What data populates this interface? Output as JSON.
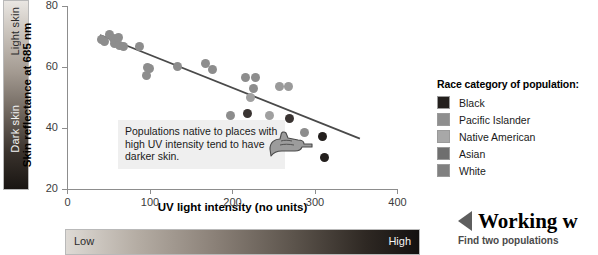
{
  "skin_scale": {
    "light_label": "Light skin",
    "dark_label": "Dark skin"
  },
  "uv_scale": {
    "low_label": "Low",
    "high_label": "High"
  },
  "annotation": {
    "text": "Populations native to places with high UV intensity tend to have darker skin.",
    "icon": "pointing-hand-icon"
  },
  "legend": {
    "title": "Race category of population:",
    "items": [
      {
        "label": "Black",
        "color": "#231f1d"
      },
      {
        "label": "Pacific Islander",
        "color": "#8e8e8e"
      },
      {
        "label": "Native American",
        "color": "#a8a8a8"
      },
      {
        "label": "Asian",
        "color": "#6f6f6f"
      },
      {
        "label": "White",
        "color": "#808080"
      }
    ]
  },
  "callout": {
    "title": "Working w",
    "subtitle": "Find two populations"
  },
  "chart_data": {
    "type": "scatter",
    "title": "",
    "xlabel": "UV light intensity (no units)",
    "ylabel": "Skin reflectance at 685 nm",
    "xlim": [
      0,
      400
    ],
    "ylim": [
      20,
      80
    ],
    "xticks": [
      0,
      100,
      200,
      300,
      400
    ],
    "yticks": [
      20,
      40,
      60,
      80
    ],
    "grid": false,
    "legend_position": "right",
    "trendline": {
      "x0": 40,
      "y0": 70.5,
      "x1": 355,
      "y1": 36.5,
      "color": "#4a4a4a"
    },
    "points": [
      {
        "x": 42,
        "y": 69.0,
        "color": "#8d8d8d"
      },
      {
        "x": 46,
        "y": 68.4,
        "color": "#8d8d8d"
      },
      {
        "x": 52,
        "y": 70.6,
        "color": "#8d8d8d"
      },
      {
        "x": 56,
        "y": 69.4,
        "color": "#8d8d8d"
      },
      {
        "x": 58,
        "y": 67.6,
        "color": "#8d8d8d"
      },
      {
        "x": 62,
        "y": 69.8,
        "color": "#8d8d8d"
      },
      {
        "x": 64,
        "y": 67.0,
        "color": "#8d8d8d"
      },
      {
        "x": 68,
        "y": 66.8,
        "color": "#8d8d8d"
      },
      {
        "x": 88,
        "y": 66.8,
        "color": "#8d8d8d"
      },
      {
        "x": 98,
        "y": 60.0,
        "color": "#8d8d8d"
      },
      {
        "x": 100,
        "y": 59.4,
        "color": "#8d8d8d"
      },
      {
        "x": 96,
        "y": 57.2,
        "color": "#8d8d8d"
      },
      {
        "x": 134,
        "y": 60.2,
        "color": "#8d8d8d"
      },
      {
        "x": 168,
        "y": 61.0,
        "color": "#8d8d8d"
      },
      {
        "x": 176,
        "y": 59.2,
        "color": "#8d8d8d"
      },
      {
        "x": 216,
        "y": 56.4,
        "color": "#8d8d8d"
      },
      {
        "x": 228,
        "y": 56.6,
        "color": "#8d8d8d"
      },
      {
        "x": 226,
        "y": 53.0,
        "color": "#8d8d8d"
      },
      {
        "x": 222,
        "y": 50.0,
        "color": "#a0a0a0"
      },
      {
        "x": 198,
        "y": 44.2,
        "color": "#8d8d8d"
      },
      {
        "x": 219,
        "y": 44.8,
        "color": "#3a3432"
      },
      {
        "x": 245,
        "y": 44.0,
        "color": "#a0a0a0"
      },
      {
        "x": 258,
        "y": 53.6,
        "color": "#9a9a9a"
      },
      {
        "x": 268,
        "y": 53.6,
        "color": "#9a9a9a"
      },
      {
        "x": 270,
        "y": 43.2,
        "color": "#3a3432"
      },
      {
        "x": 288,
        "y": 38.6,
        "color": "#8d8d8d"
      },
      {
        "x": 262,
        "y": 35.0,
        "color": "#231f1d"
      },
      {
        "x": 272,
        "y": 35.0,
        "color": "#231f1d"
      },
      {
        "x": 310,
        "y": 37.2,
        "color": "#231f1d"
      },
      {
        "x": 312,
        "y": 30.2,
        "color": "#231f1d"
      }
    ]
  }
}
